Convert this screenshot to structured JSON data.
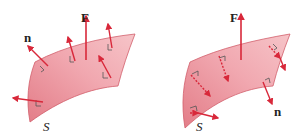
{
  "diagram": {
    "left_panel": {
      "surface_label": "S",
      "field_label": "F",
      "normal_label": "n",
      "description": "Field F and normals n point outward on the same side of surface S"
    },
    "right_panel": {
      "surface_label": "S",
      "field_label": "F",
      "normal_label": "n",
      "description": "Field F points up while normals n (dashed, below) point to the opposite side of surface S"
    },
    "colors": {
      "arrow": "#d8283a",
      "surface_light": "#f6c4c8",
      "surface_dark": "#e37d88",
      "surface_edge": "#d2606c",
      "right_angle_mark": "#555555",
      "label": "#222222"
    }
  }
}
